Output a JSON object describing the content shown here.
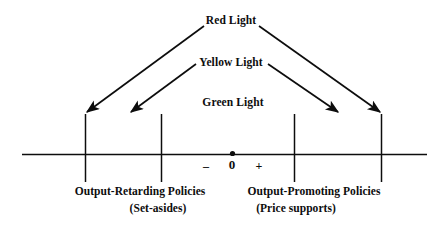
{
  "diagram": {
    "title_text": "",
    "colors": {
      "ink": "#0d0d0d",
      "background": "#ffffff"
    },
    "lights": {
      "red": "Red Light",
      "yellow": "Yellow Light",
      "green": "Green Light"
    },
    "axis": {
      "zero_label": "0",
      "minus_label": "–",
      "plus_label": "+",
      "origin_dot": true,
      "tick_count": 4
    },
    "left_policy": {
      "title": "Output-Retarding Policies",
      "subtitle": "(Set-asides)"
    },
    "right_policy": {
      "title": "Output-Promoting Policies",
      "subtitle": "(Price supports)"
    }
  }
}
